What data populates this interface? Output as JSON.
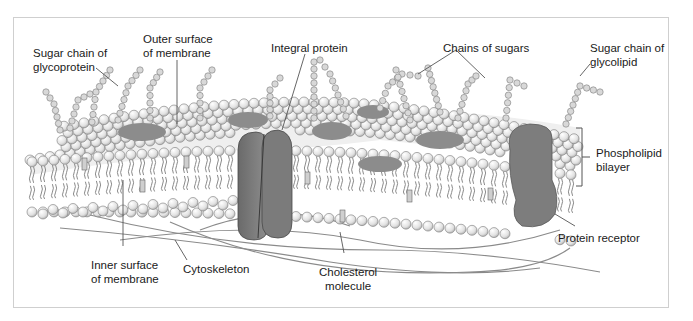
{
  "figure": {
    "colors": {
      "frame_border": "#cfcfcf",
      "lipid_head": "#e6e6e6",
      "lipid_head_stroke": "#7a7a7a",
      "tail": "#8a8a8a",
      "protein_dark": "#707070",
      "protein_mid": "#8c8c8c",
      "sugar_bead": "#d8d8d8",
      "cytoskeleton": "#8a8a8a",
      "leader_line": "#555555",
      "text": "#1a1a1a"
    }
  },
  "labels": {
    "sugar_chain_glycoprotein": "Sugar chain of\nglycoprotein",
    "outer_surface": "Outer surface\nof membrane",
    "integral_protein": "Integral protein",
    "chains_of_sugars": "Chains of sugars",
    "sugar_chain_glycolipid": "Sugar chain of\nglycolipid",
    "phospholipid_bilayer": "Phospholipid\nbilayer",
    "protein_receptor": "Protein receptor",
    "inner_surface": "Inner surface\nof membrane",
    "cytoskeleton": "Cytoskeleton",
    "cholesterol_molecule": "Cholesterol\nmolecule"
  }
}
